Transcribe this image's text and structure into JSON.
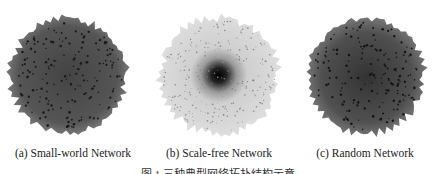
{
  "figure": {
    "panels": [
      {
        "id": "a",
        "label": "(a) Small-world Network",
        "left": 0,
        "cx": 68,
        "style": "dense-dark",
        "fill": "#5a5a5a",
        "edge": "#777777",
        "dots": "#222222"
      },
      {
        "id": "b",
        "label": "(b) Scale-free Network",
        "left": 146,
        "cx": 73,
        "style": "hub-light",
        "fill": "#d9d9d9",
        "edge": "#c4c4c4",
        "dots": "#111111"
      },
      {
        "id": "c",
        "label": "(c) Random Network",
        "left": 292,
        "cx": 74,
        "style": "dense-dark",
        "fill": "#555555",
        "edge": "#6f6f6f",
        "dots": "#1e1e1e"
      }
    ],
    "caption": "图 1   三种典型网络拓扑结构示意"
  }
}
